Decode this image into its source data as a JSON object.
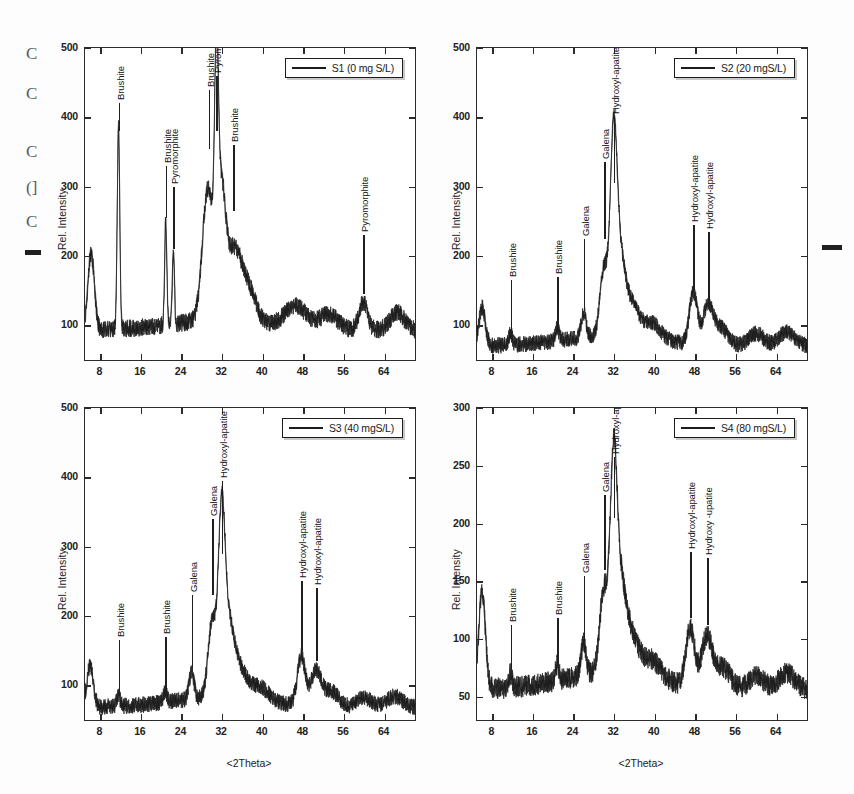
{
  "figure": {
    "width": 854,
    "height": 794,
    "background": "#ffffff",
    "ink_color": "#1f1f1f"
  },
  "margin_artifacts": {
    "left_glyphs": [
      "C",
      "C",
      "C",
      "(]",
      "C"
    ],
    "left_dash": "—",
    "right_dash": "—"
  },
  "chart_data": [
    {
      "id": "panel-1",
      "type": "line",
      "title": "",
      "legend": "S1 (0 mg S/L)",
      "legend_position": "top-right",
      "xlabel": "<2Theta>",
      "ylabel": "Rel. Intensity",
      "xlim": [
        5,
        70
      ],
      "ylim": [
        50,
        500
      ],
      "xticks": [
        8,
        16,
        24,
        32,
        40,
        48,
        56,
        64
      ],
      "yticks": [
        100,
        200,
        300,
        400,
        500
      ],
      "grid": false,
      "annotations": [
        {
          "label": "Brushite",
          "x": 11.6,
          "peak_y": 380,
          "text_y": 420
        },
        {
          "label": "Brushite",
          "x": 20.9,
          "peak_y": 255,
          "text_y": 330
        },
        {
          "label": "Pyromorphite",
          "x": 22.4,
          "peak_y": 210,
          "text_y": 300
        },
        {
          "label": "Brushite",
          "x": 29.4,
          "peak_y": 355,
          "text_y": 440
        },
        {
          "label": "Pyromorphite",
          "x": 30.9,
          "peak_y": 380,
          "text_y": 460
        },
        {
          "label": "Brushite",
          "x": 34.2,
          "peak_y": 265,
          "text_y": 360
        },
        {
          "label": "Pyromorphite",
          "x": 59.8,
          "peak_y": 145,
          "text_y": 230
        }
      ],
      "series": [
        {
          "name": "S1 (0 mg S/L)",
          "baseline": 95,
          "noise": 11,
          "peaks": [
            {
              "x": 6.2,
              "height": 110,
              "width": 0.9
            },
            {
              "x": 11.6,
              "height": 290,
              "width": 0.35
            },
            {
              "x": 20.9,
              "height": 150,
              "width": 0.3
            },
            {
              "x": 22.4,
              "height": 105,
              "width": 0.3
            },
            {
              "x": 29.2,
              "height": 190,
              "width": 1.5
            },
            {
              "x": 30.9,
              "height": 285,
              "width": 0.5
            },
            {
              "x": 31.8,
              "height": 175,
              "width": 1.2
            },
            {
              "x": 34.2,
              "height": 95,
              "width": 2.0
            },
            {
              "x": 37.0,
              "height": 50,
              "width": 2.2
            },
            {
              "x": 46.5,
              "height": 32,
              "width": 3.0
            },
            {
              "x": 53.0,
              "height": 22,
              "width": 2.5
            },
            {
              "x": 59.8,
              "height": 40,
              "width": 1.2
            },
            {
              "x": 66.5,
              "height": 25,
              "width": 2.0
            }
          ]
        }
      ]
    },
    {
      "id": "panel-2",
      "type": "line",
      "title": "",
      "legend": "S2 (20 mgS/L)",
      "legend_position": "top-right",
      "xlabel": "<2Theta>",
      "ylabel": "Rel. Intensity",
      "xlim": [
        5,
        70
      ],
      "ylim": [
        50,
        500
      ],
      "xticks": [
        8,
        16,
        24,
        32,
        40,
        48,
        56,
        64
      ],
      "yticks": [
        100,
        200,
        300,
        400,
        500
      ],
      "grid": false,
      "annotations": [
        {
          "label": "Brushite",
          "x": 11.6,
          "peak_y": 85,
          "text_y": 165
        },
        {
          "label": "Brushite",
          "x": 20.8,
          "peak_y": 90,
          "text_y": 170
        },
        {
          "label": "Galena",
          "x": 26.0,
          "peak_y": 120,
          "text_y": 225
        },
        {
          "label": "Galena",
          "x": 30.0,
          "peak_y": 225,
          "text_y": 335
        },
        {
          "label": "Hydroxyl-apatite",
          "x": 31.9,
          "peak_y": 305,
          "text_y": 400
        },
        {
          "label": "Hydroxyl-apatite",
          "x": 47.6,
          "peak_y": 150,
          "text_y": 245
        },
        {
          "label": "Hydroxyl-apatite",
          "x": 50.5,
          "peak_y": 135,
          "text_y": 235
        }
      ],
      "series": [
        {
          "name": "S2 (20 mgS/L)",
          "baseline": 72,
          "noise": 10,
          "peaks": [
            {
              "x": 6.0,
              "height": 55,
              "width": 0.9
            },
            {
              "x": 11.6,
              "height": 16,
              "width": 0.5
            },
            {
              "x": 20.8,
              "height": 18,
              "width": 0.5
            },
            {
              "x": 26.0,
              "height": 35,
              "width": 0.7
            },
            {
              "x": 30.0,
              "height": 95,
              "width": 1.1
            },
            {
              "x": 31.9,
              "height": 230,
              "width": 0.9
            },
            {
              "x": 32.9,
              "height": 120,
              "width": 1.6
            },
            {
              "x": 35.5,
              "height": 45,
              "width": 2.0
            },
            {
              "x": 39.5,
              "height": 24,
              "width": 2.4
            },
            {
              "x": 47.6,
              "height": 75,
              "width": 1.1
            },
            {
              "x": 50.5,
              "height": 55,
              "width": 1.4
            },
            {
              "x": 53.0,
              "height": 25,
              "width": 2.0
            },
            {
              "x": 60.0,
              "height": 18,
              "width": 2.0
            },
            {
              "x": 66.0,
              "height": 20,
              "width": 2.2
            }
          ]
        }
      ]
    },
    {
      "id": "panel-3",
      "type": "line",
      "title": "",
      "legend": "S3 (40 mgS/L)",
      "legend_position": "top-right",
      "xlabel": "<2Theta>",
      "ylabel": "Rel. Intensity",
      "xlim": [
        5,
        70
      ],
      "ylim": [
        50,
        500
      ],
      "xticks": [
        8,
        16,
        24,
        32,
        40,
        48,
        56,
        64
      ],
      "yticks": [
        100,
        200,
        300,
        400,
        500
      ],
      "grid": false,
      "annotations": [
        {
          "label": "Brushite",
          "x": 11.6,
          "peak_y": 85,
          "text_y": 165
        },
        {
          "label": "Brushite",
          "x": 20.8,
          "peak_y": 90,
          "text_y": 170
        },
        {
          "label": "Galena",
          "x": 26.0,
          "peak_y": 125,
          "text_y": 230
        },
        {
          "label": "Galena",
          "x": 30.0,
          "peak_y": 230,
          "text_y": 340
        },
        {
          "label": "Hydroxyl-apatite",
          "x": 31.9,
          "peak_y": 290,
          "text_y": 395
        },
        {
          "label": "Hydroxyl-apatite",
          "x": 47.6,
          "peak_y": 150,
          "text_y": 250
        },
        {
          "label": "Hydroxyl-apatite",
          "x": 50.5,
          "peak_y": 135,
          "text_y": 240
        }
      ],
      "series": [
        {
          "name": "S3 (40 mgS/L)",
          "baseline": 70,
          "noise": 10,
          "peaks": [
            {
              "x": 6.0,
              "height": 60,
              "width": 0.9
            },
            {
              "x": 11.6,
              "height": 14,
              "width": 0.5
            },
            {
              "x": 20.8,
              "height": 16,
              "width": 0.5
            },
            {
              "x": 26.0,
              "height": 38,
              "width": 0.7
            },
            {
              "x": 30.0,
              "height": 105,
              "width": 1.1
            },
            {
              "x": 31.9,
              "height": 215,
              "width": 0.9
            },
            {
              "x": 33.0,
              "height": 110,
              "width": 1.7
            },
            {
              "x": 35.5,
              "height": 40,
              "width": 2.1
            },
            {
              "x": 39.5,
              "height": 20,
              "width": 2.4
            },
            {
              "x": 47.6,
              "height": 70,
              "width": 1.1
            },
            {
              "x": 50.5,
              "height": 50,
              "width": 1.5
            },
            {
              "x": 53.5,
              "height": 22,
              "width": 2.0
            },
            {
              "x": 60.0,
              "height": 14,
              "width": 2.0
            },
            {
              "x": 66.0,
              "height": 16,
              "width": 2.2
            }
          ]
        }
      ]
    },
    {
      "id": "panel-4",
      "type": "line",
      "title": "",
      "legend": "S4 (80 mgS/L)",
      "legend_position": "top-right",
      "xlabel": "<2Theta>",
      "ylabel": "Rel. Intensity",
      "xlim": [
        5,
        70
      ],
      "ylim": [
        30,
        300
      ],
      "xticks": [
        8,
        16,
        24,
        32,
        40,
        48,
        56,
        64
      ],
      "yticks": [
        50,
        100,
        150,
        200,
        250,
        300
      ],
      "grid": false,
      "annotations": [
        {
          "label": "Brushite",
          "x": 11.6,
          "peak_y": 73,
          "text_y": 112
        },
        {
          "label": "Brushite",
          "x": 20.8,
          "peak_y": 78,
          "text_y": 118
        },
        {
          "label": "Galena",
          "x": 26.0,
          "peak_y": 95,
          "text_y": 155
        },
        {
          "label": "Galena",
          "x": 30.0,
          "peak_y": 160,
          "text_y": 225
        },
        {
          "label": "Hydroxyl-apatite",
          "x": 31.9,
          "peak_y": 205,
          "text_y": 258
        },
        {
          "label": "Hydroxyl-apatite",
          "x": 47.0,
          "peak_y": 118,
          "text_y": 175
        },
        {
          "label": "Hydroxy -upatite",
          "x": 50.3,
          "peak_y": 112,
          "text_y": 170
        }
      ],
      "series": [
        {
          "name": "S4 (80 mgS/L)",
          "baseline": 58,
          "noise": 8,
          "peaks": [
            {
              "x": 6.0,
              "height": 85,
              "width": 0.9
            },
            {
              "x": 11.6,
              "height": 12,
              "width": 0.5
            },
            {
              "x": 20.8,
              "height": 14,
              "width": 0.5
            },
            {
              "x": 26.0,
              "height": 28,
              "width": 0.7
            },
            {
              "x": 30.0,
              "height": 70,
              "width": 1.2
            },
            {
              "x": 31.9,
              "height": 145,
              "width": 0.9
            },
            {
              "x": 33.0,
              "height": 80,
              "width": 1.7
            },
            {
              "x": 35.5,
              "height": 30,
              "width": 2.1
            },
            {
              "x": 39.5,
              "height": 16,
              "width": 2.4
            },
            {
              "x": 47.0,
              "height": 50,
              "width": 1.2
            },
            {
              "x": 50.3,
              "height": 44,
              "width": 1.5
            },
            {
              "x": 53.5,
              "height": 18,
              "width": 2.0
            },
            {
              "x": 60.0,
              "height": 12,
              "width": 2.0
            },
            {
              "x": 66.0,
              "height": 14,
              "width": 2.2
            }
          ]
        }
      ]
    }
  ]
}
